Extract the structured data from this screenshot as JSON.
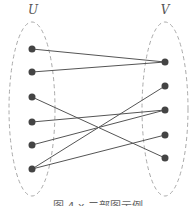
{
  "diagram": {
    "type": "bipartite-graph",
    "sets": [
      {
        "id": "U",
        "label": "U",
        "label_pos": [
          33,
          14
        ],
        "ellipse": {
          "cx": 32,
          "cy": 109,
          "rx": 23,
          "ry": 87
        }
      },
      {
        "id": "V",
        "label": "V",
        "label_pos": [
          165,
          14
        ],
        "ellipse": {
          "cx": 165,
          "cy": 109,
          "rx": 23,
          "ry": 87
        }
      }
    ],
    "nodes": [
      {
        "id": "u1",
        "set": "U",
        "x": 32,
        "y": 49
      },
      {
        "id": "u2",
        "set": "U",
        "x": 32,
        "y": 72
      },
      {
        "id": "u3",
        "set": "U",
        "x": 32,
        "y": 97
      },
      {
        "id": "u4",
        "set": "U",
        "x": 32,
        "y": 122
      },
      {
        "id": "u5",
        "set": "U",
        "x": 32,
        "y": 145
      },
      {
        "id": "u6",
        "set": "U",
        "x": 32,
        "y": 169
      },
      {
        "id": "v1",
        "set": "V",
        "x": 165,
        "y": 62
      },
      {
        "id": "v2",
        "set": "V",
        "x": 165,
        "y": 86
      },
      {
        "id": "v3",
        "set": "V",
        "x": 165,
        "y": 110
      },
      {
        "id": "v4",
        "set": "V",
        "x": 165,
        "y": 135
      },
      {
        "id": "v5",
        "set": "V",
        "x": 165,
        "y": 158
      }
    ],
    "edges": [
      [
        "u1",
        "v1"
      ],
      [
        "u2",
        "v1"
      ],
      [
        "u3",
        "v5"
      ],
      [
        "u4",
        "v3"
      ],
      [
        "u5",
        "v3"
      ],
      [
        "u6",
        "v2"
      ],
      [
        "u6",
        "v4"
      ]
    ],
    "colors": {
      "node": "#444444",
      "edge": "#555555",
      "ellipse": "#aaaaaa",
      "label": "#555555"
    },
    "caption": "图 4.x  二部图示例"
  }
}
